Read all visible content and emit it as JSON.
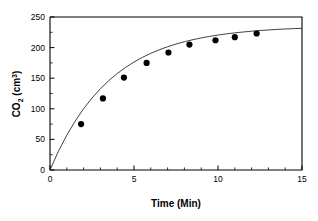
{
  "chart_data": {
    "type": "scatter",
    "title": "",
    "xlabel": "Time (Min)",
    "ylabel": "CO2 (cm3)",
    "ylabel_base": "CO",
    "ylabel_subscript": "2",
    "ylabel_unit_open": " (cm",
    "ylabel_superscript": "3",
    "ylabel_unit_close": ")",
    "xlim": [
      0,
      15
    ],
    "ylim": [
      0,
      250
    ],
    "x_ticks": [
      0,
      5,
      10,
      15
    ],
    "x_tick_labels": [
      "0",
      "5",
      "10",
      "15"
    ],
    "x_minor_ticks": [
      1,
      2,
      3,
      4,
      6,
      7,
      8,
      9,
      11,
      12,
      13,
      14
    ],
    "y_ticks": [
      0,
      50,
      100,
      150,
      200,
      250
    ],
    "y_tick_labels": [
      "0",
      "50",
      "100",
      "150",
      "200",
      "250"
    ],
    "y_minor_ticks": [
      25,
      75,
      125,
      175,
      225
    ],
    "grid": false,
    "legend": null,
    "marker_color": "#000000",
    "curve_color": "#2b2b2b",
    "axis_color": "#000000",
    "background_color": "#ffffff",
    "points": [
      {
        "x": 1.85,
        "y": 75
      },
      {
        "x": 3.15,
        "y": 117
      },
      {
        "x": 4.4,
        "y": 151
      },
      {
        "x": 5.75,
        "y": 175
      },
      {
        "x": 7.05,
        "y": 192
      },
      {
        "x": 8.3,
        "y": 205
      },
      {
        "x": 9.85,
        "y": 212
      },
      {
        "x": 11.0,
        "y": 217
      },
      {
        "x": 12.3,
        "y": 223
      }
    ],
    "fit_curve": {
      "description": "saturating exponential rise",
      "model": "y = 232 * (1 - exp(-x / 3.55))",
      "asymptote": 232,
      "time_constant": 3.55,
      "points": [
        {
          "x": 0.0,
          "y": 0
        },
        {
          "x": 0.5,
          "y": 30.5
        },
        {
          "x": 1.0,
          "y": 57.0
        },
        {
          "x": 1.5,
          "y": 80.0
        },
        {
          "x": 2.0,
          "y": 100.1
        },
        {
          "x": 2.5,
          "y": 117.6
        },
        {
          "x": 3.0,
          "y": 132.8
        },
        {
          "x": 3.5,
          "y": 146.1
        },
        {
          "x": 4.0,
          "y": 157.6
        },
        {
          "x": 4.5,
          "y": 167.7
        },
        {
          "x": 5.0,
          "y": 176.4
        },
        {
          "x": 5.5,
          "y": 184.0
        },
        {
          "x": 6.0,
          "y": 190.6
        },
        {
          "x": 6.5,
          "y": 196.4
        },
        {
          "x": 7.0,
          "y": 201.4
        },
        {
          "x": 7.5,
          "y": 205.8
        },
        {
          "x": 8.0,
          "y": 209.6
        },
        {
          "x": 8.5,
          "y": 212.9
        },
        {
          "x": 9.0,
          "y": 215.8
        },
        {
          "x": 9.5,
          "y": 218.3
        },
        {
          "x": 10.0,
          "y": 220.5
        },
        {
          "x": 10.5,
          "y": 222.4
        },
        {
          "x": 11.0,
          "y": 224.1
        },
        {
          "x": 11.5,
          "y": 225.5
        },
        {
          "x": 12.0,
          "y": 226.8
        },
        {
          "x": 12.5,
          "y": 227.9
        },
        {
          "x": 13.0,
          "y": 228.8
        },
        {
          "x": 13.5,
          "y": 229.7
        },
        {
          "x": 14.0,
          "y": 230.4
        },
        {
          "x": 14.5,
          "y": 231.0
        },
        {
          "x": 15.0,
          "y": 231.5
        }
      ]
    }
  },
  "geometry": {
    "plot_left": 50,
    "plot_right": 302,
    "plot_top": 17,
    "plot_bottom": 170,
    "marker_radius": 3.1,
    "tick_major_len": 4.5,
    "tick_minor_len": 2.6
  }
}
